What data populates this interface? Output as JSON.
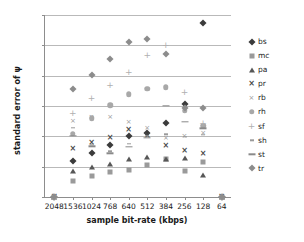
{
  "chart_data": {
    "type": "scatter",
    "title": "",
    "xlabel": "sample bit-rate (kbps)",
    "ylabel": "standard error of  ψ",
    "categories": [
      "2048",
      "1536",
      "1024",
      "768",
      "640",
      "512",
      "384",
      "256",
      "128",
      "64"
    ],
    "ylim": [
      0,
      0.12
    ],
    "yticks": [
      "0",
      "0,02",
      "0,04",
      "0,06",
      "0,08",
      "0,1",
      "0,12"
    ],
    "ytick_values": [
      0,
      0.02,
      0.04,
      0.06,
      0.08,
      0.1,
      0.12
    ],
    "grid": "horizontal",
    "legend_position": "right",
    "decimal_separator": ",",
    "series": [
      {
        "name": "bs",
        "marker": "diamond",
        "color": "#3b3b3b",
        "values": [
          0,
          0.0235,
          0.0289,
          0.0345,
          0.0401,
          0.0424,
          0.0487,
          0.0616,
          0.1149,
          0
        ]
      },
      {
        "name": "mc",
        "marker": "square",
        "color": "#9a9a9a",
        "values": [
          0,
          0.0106,
          0.0136,
          0.0167,
          0.018,
          0.0212,
          0.0252,
          0.0172,
          0.023,
          0
        ]
      },
      {
        "name": "pa",
        "marker": "triangle",
        "color": "#575757",
        "values": [
          0,
          0.0169,
          0.0196,
          0.0216,
          0.0248,
          0.0263,
          0.0251,
          0.0254,
          0.0147,
          0
        ]
      },
      {
        "name": "pr",
        "marker": "x-bold",
        "color": "#4a4a4a",
        "values": [
          0,
          0.0316,
          0.0355,
          0.0392,
          0.0439,
          0.0405,
          0.0336,
          0.0304,
          0.0281,
          0
        ]
      },
      {
        "name": "rb",
        "marker": "x-light",
        "color": "#9a9a9a",
        "values": [
          0,
          0.0504,
          0.0525,
          0.0528,
          0.0493,
          0.0455,
          0.0391,
          0.0401,
          0.0423,
          0
        ]
      },
      {
        "name": "rh",
        "marker": "circle",
        "color": "#a8a8a8",
        "values": [
          0,
          0.0418,
          0.0519,
          0.0604,
          0.0676,
          0.0714,
          0.0722,
          0.057,
          0.047,
          0
        ]
      },
      {
        "name": "sf",
        "marker": "plus",
        "color": "#b0b0b0",
        "values": [
          0,
          0.0551,
          0.0654,
          0.0737,
          0.0826,
          0.0938,
          0.0999,
          0.0691,
          0.0486,
          0
        ]
      },
      {
        "name": "sh",
        "marker": "dash-small",
        "color": "#9a9a9a",
        "values": [
          0,
          0.0456,
          0.0344,
          0.0301,
          0.0352,
          0.0403,
          0.0414,
          0.0397,
          0.041,
          0
        ]
      },
      {
        "name": "st",
        "marker": "dash",
        "color": "#8a8a8a",
        "values": [
          0,
          0.0404,
          0.0333,
          0.0288,
          0.0329,
          0.0392,
          0.0601,
          0.0494,
          0.0452,
          0
        ]
      },
      {
        "name": "tr",
        "marker": "diamond-light",
        "color": "#8c8c8c",
        "values": [
          0,
          0.0709,
          0.0806,
          0.091,
          0.1024,
          0.1039,
          0.0941,
          0.0586,
          0.059,
          0
        ]
      }
    ]
  }
}
